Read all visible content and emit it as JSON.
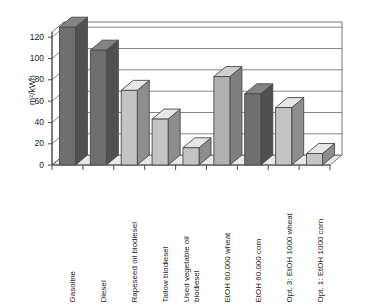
{
  "chart_data": {
    "type": "bar",
    "title": "",
    "subtitle": "",
    "xlabel": "",
    "ylabel": "m²/kWh",
    "ylim": [
      0,
      130
    ],
    "yticks": [
      0,
      20,
      40,
      60,
      80,
      100,
      120
    ],
    "grid": true,
    "legend": "none",
    "style": "3d-column",
    "categories": [
      "Gasoline",
      "Diesel",
      "Rapeseed oil biodiesel",
      "Tallow biodiesel",
      "Used vegetable oil biodiesel",
      "EtOH 60.000 wheat",
      "EtOH 60.000 corn",
      "Opt. 3: EtOH 1000 wheat",
      "Opt. 1: EtOH 1000 corn"
    ],
    "category_lines": [
      [
        "Gasoline"
      ],
      [
        "Diesel"
      ],
      [
        "Rapeseed oil biodiesel"
      ],
      [
        "Tallow biodiesel"
      ],
      [
        "Used vegetable oil",
        "biodiesel"
      ],
      [
        "EtOH 60.000 wheat"
      ],
      [
        "EtOH 60.000 corn"
      ],
      [
        "Opt. 3: EtOH 1000 wheat"
      ],
      [
        "Opt. 1: EtOH 1000 corn"
      ]
    ],
    "values": [
      120,
      100,
      65,
      40,
      15,
      77,
      62,
      50,
      10
    ],
    "bar_colors": [
      "#6f6f6f",
      "#6f6f6f",
      "#c4c4c4",
      "#c4c4c4",
      "#c4c4c4",
      "#b0b0b0",
      "#6f6f6f",
      "#c4c4c4",
      "#c4c4c4"
    ],
    "colors": {
      "axis": "#4a4a4a",
      "gridline": "#5a5a5a",
      "floor": "#e9e9e9",
      "wall": "#ffffff",
      "bar_dark": "#6f6f6f",
      "bar_light": "#c4c4c4",
      "bar_outline": "#4a4a4a",
      "text": "#1d1d1d",
      "background": "#ffffff"
    }
  }
}
